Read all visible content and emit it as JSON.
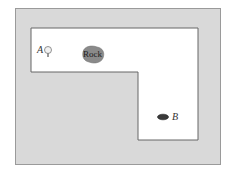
{
  "diagram": {
    "title": "",
    "labels": {
      "start": "A",
      "end": "B",
      "obstacle": "Rock"
    },
    "colors": {
      "rough": "#d9d9d9",
      "fairway": "#ffffff",
      "border": "#666666",
      "rock": "#8a8a8a",
      "hole": "#3a3a3a"
    }
  }
}
